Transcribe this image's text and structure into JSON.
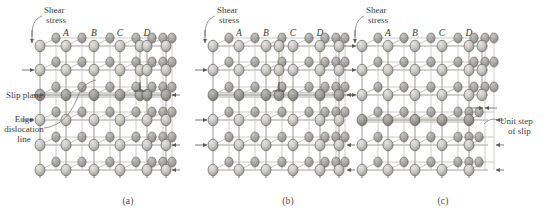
{
  "figure": {
    "panels": [
      {
        "id": "a",
        "caption": "(a)",
        "column_labels": [
          "A",
          "B",
          "C",
          "D"
        ],
        "annotations": [
          {
            "name": "shear-stress",
            "text_lines": [
              "Shear",
              "stress"
            ]
          },
          {
            "name": "slip-plane",
            "text_lines": [
              "Slip plane"
            ]
          },
          {
            "name": "edge-dislocation-line",
            "text_lines": [
              "Edge",
              "dislocation",
              "line"
            ]
          }
        ]
      },
      {
        "id": "b",
        "caption": "(b)",
        "column_labels": [
          "A",
          "B",
          "C",
          "D"
        ],
        "annotations": [
          {
            "name": "shear-stress",
            "text_lines": [
              "Shear",
              "stress"
            ]
          }
        ]
      },
      {
        "id": "c",
        "caption": "(c)",
        "column_labels": [
          "A",
          "B",
          "C",
          "D"
        ],
        "annotations": [
          {
            "name": "shear-stress",
            "text_lines": [
              "Shear",
              "stress"
            ]
          },
          {
            "name": "unit-step-of-slip",
            "text_lines": [
              "Unit step",
              "of slip"
            ]
          }
        ]
      }
    ],
    "colors": {
      "background": "#ffffff",
      "atom_light": "#d5d4d0",
      "atom_mid": "#b9b8b4",
      "atom_dark": "#8d8c88",
      "atom_outline": "#4c4c4c",
      "bond": "#9a9a96",
      "text": "#3d3d3d",
      "leader": "#6c6c6c"
    },
    "lattice": {
      "rows": 6,
      "columns": 8,
      "slip_plane_row_index": 2
    }
  }
}
